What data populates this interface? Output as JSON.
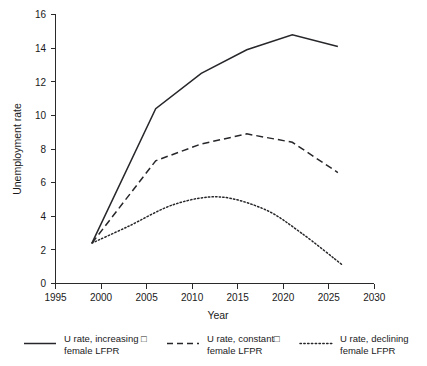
{
  "chart_data": {
    "type": "line",
    "title": "",
    "xlabel": "Year",
    "ylabel": "Unemployment rate",
    "xlim": [
      1995,
      2030
    ],
    "ylim": [
      0,
      16
    ],
    "xticks": [
      1995,
      2000,
      2005,
      2010,
      2015,
      2020,
      2025,
      2030
    ],
    "xtick_labels": [
      "1995",
      "2000",
      "2005",
      "2010",
      "2015",
      "2020",
      "2025",
      "2030"
    ],
    "yticks": [
      0,
      2,
      4,
      6,
      8,
      10,
      12,
      14,
      16
    ],
    "ytick_labels": [
      "0",
      "2",
      "4",
      "6",
      "8",
      "10",
      "12",
      "14",
      "16"
    ],
    "grid": false,
    "legend_position": "below",
    "series": [
      {
        "name": "U rate, increasing □ female LFPR",
        "style": "solid",
        "x": [
          1999,
          2006,
          2011,
          2016,
          2021,
          2026
        ],
        "values": [
          2.4,
          10.4,
          12.5,
          13.9,
          14.8,
          14.1
        ]
      },
      {
        "name": "U rate, constant□ female LFPR",
        "style": "dashed",
        "x": [
          1999,
          2006,
          2011,
          2016,
          2021,
          2026
        ],
        "values": [
          2.4,
          7.3,
          8.3,
          8.9,
          8.4,
          6.6
        ]
      },
      {
        "name": "U rate, declining female LFPR",
        "style": "dotted",
        "x": [
          1999,
          2003,
          2008,
          2013,
          2018,
          2022,
          2026.5
        ],
        "values": [
          2.4,
          3.4,
          4.7,
          5.15,
          4.4,
          3.0,
          1.1
        ]
      }
    ]
  },
  "legend": {
    "entries": [
      {
        "line1": "U rate, increasing □",
        "line2": "female LFPR",
        "key": "solid-line-key"
      },
      {
        "line1": "U rate, constant□",
        "line2": "female LFPR",
        "key": "dashed-line-key"
      },
      {
        "line1": "U rate, declining",
        "line2": "female LFPR",
        "key": "dotted-line-key"
      }
    ]
  },
  "colors": {
    "line": "#27272b",
    "axis": "#2a2a2a",
    "background": "#ffffff",
    "text": "#1a1a1a"
  }
}
